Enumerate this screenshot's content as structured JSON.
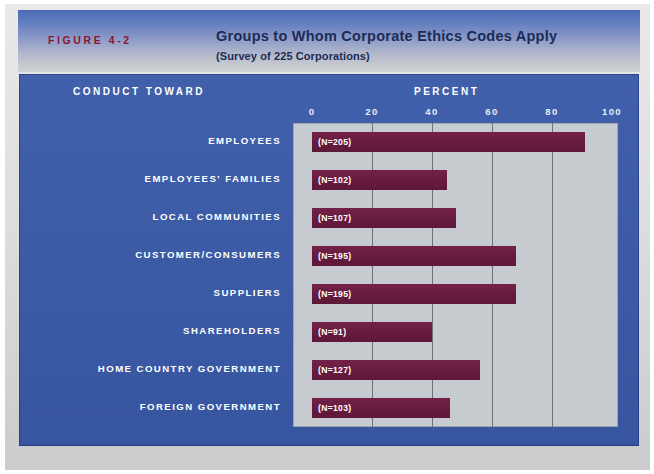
{
  "figure": {
    "tag": "FIGURE 4-2",
    "title": "Groups to Whom Corporate Ethics Codes Apply",
    "subtitle": "(Survey of 225 Corporations)"
  },
  "axes": {
    "category_header": "CONDUCT TOWARD",
    "value_header": "PERCENT"
  },
  "colors": {
    "panel_blue": "#3a5aa8",
    "bar_maroon": "#6b1d42",
    "plot_gray": "#c6cbd0",
    "tag_red": "#8c1436",
    "title_navy": "#1b2c55"
  },
  "chart_data": {
    "type": "bar",
    "orientation": "horizontal",
    "title": "Groups to Whom Corporate Ethics Codes Apply",
    "subtitle": "(Survey of 225 Corporations)",
    "xlabel": "PERCENT",
    "ylabel": "CONDUCT TOWARD",
    "xlim": [
      0,
      100
    ],
    "xticks": [
      0,
      20,
      40,
      60,
      80,
      100
    ],
    "xticklabels": [
      "0",
      "20",
      "40",
      "60",
      "80",
      "100"
    ],
    "grid": "vertical",
    "legend": "none",
    "categories": [
      "EMPLOYEES",
      "EMPLOYEES' FAMILIES",
      "LOCAL COMMUNITIES",
      "CUSTOMER/CONSUMERS",
      "SUPPLIERS",
      "SHAREHOLDERS",
      "HOME COUNTRY GOVERNMENT",
      "FOREIGN GOVERNMENT"
    ],
    "values": [
      91,
      45,
      48,
      68,
      68,
      40,
      56,
      46
    ],
    "annotations": [
      "(N=205)",
      "(N=102)",
      "(N=107)",
      "(N=195)",
      "(N=195)",
      "(N=91)",
      "(N=127)",
      "(N=103)"
    ]
  }
}
